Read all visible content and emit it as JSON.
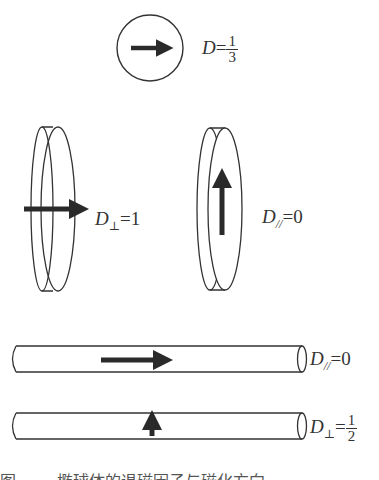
{
  "figure": {
    "sphere": {
      "symbol": "D",
      "equals": "=",
      "numerator": "1",
      "denominator": "3"
    },
    "disc_perpendicular": {
      "symbol": "D",
      "subscript": "⊥",
      "equals": "=",
      "value": "1"
    },
    "disc_parallel": {
      "symbol": "D",
      "subscript": "//",
      "equals": "=",
      "value": "0"
    },
    "rod_parallel": {
      "symbol": "D",
      "subscript": "//",
      "equals": "=",
      "value": "0"
    },
    "rod_perpendicular": {
      "symbol": "D",
      "subscript": "⊥",
      "equals": "=",
      "numerator": "1",
      "denominator": "2"
    },
    "caption": "图 ······ 椭球体的退磁因子与磁化方向"
  },
  "colors": {
    "stroke": "#333333",
    "arrow": "#2a2a2a",
    "background": "#ffffff"
  }
}
